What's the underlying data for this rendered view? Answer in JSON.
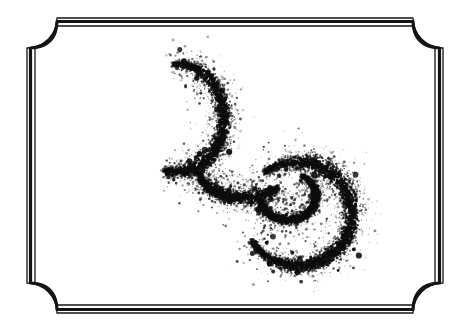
{
  "plate": {
    "width": 470,
    "height": 334,
    "background_color": "#ffffff",
    "ink_color": "#111111",
    "title": "Stippled Double-Spiral Plate",
    "caption": "",
    "has_caption": false,
    "has_text": false
  },
  "border": {
    "name": "ornamental-double-rule-frame",
    "style": "triple-rule: thin outer, thick middle, thin inner",
    "corner_style": "concave notched (inward quarter-round)",
    "color": "#141414",
    "bounds": {
      "left": 27,
      "top": 18,
      "right": 443,
      "bottom": 313
    },
    "corner_radius": 30,
    "rules": [
      {
        "name": "outer-rule",
        "inset": 0,
        "stroke_width": 1.3
      },
      {
        "name": "middle-rule",
        "inset": 3.5,
        "stroke_width": 3.2
      },
      {
        "name": "inner-rule",
        "inset": 8.0,
        "stroke_width": 1.3
      }
    ]
  },
  "figure": {
    "name": "stippled-double-spiral",
    "type": "pointillist-ink-stipple",
    "ink_color": "#0d0d0d",
    "dot_count": 7200,
    "seed": 20240517,
    "arcs": [
      {
        "name": "upper-arc",
        "shape": "c-arc-opening-right",
        "center_x": 178,
        "center_y": 118,
        "radius_x": 46,
        "radius_y": 54,
        "start_angle_deg": -96,
        "end_angle_deg": 108,
        "band_width": 17,
        "density": 1.0,
        "taper_start": 0.45,
        "taper_end": 0.95
      },
      {
        "name": "mid-connector",
        "shape": "diagonal-link",
        "center_x": 243,
        "center_y": 170,
        "radius_x": 44,
        "radius_y": 28,
        "start_angle_deg": 170,
        "end_angle_deg": 38,
        "band_width": 13,
        "density": 0.85,
        "taper_start": 0.7,
        "taper_end": 0.8
      },
      {
        "name": "lower-spiral",
        "shape": "reversed-c-spiral-opening-left",
        "center_x": 298,
        "center_y": 214,
        "radius_x": 54,
        "radius_y": 52,
        "start_angle_deg": -128,
        "end_angle_deg": 150,
        "band_width": 20,
        "density": 1.0,
        "taper_start": 0.9,
        "taper_end": 0.5
      },
      {
        "name": "inner-hook",
        "shape": "inward-curl",
        "center_x": 288,
        "center_y": 196,
        "radius_x": 28,
        "radius_y": 24,
        "start_angle_deg": -60,
        "end_angle_deg": 182,
        "band_width": 10,
        "density": 0.7,
        "taper_start": 0.6,
        "taper_end": 0.6
      }
    ],
    "spray": {
      "name": "edge-splatter",
      "count": 1500,
      "spread": 12,
      "size_min": 0.35,
      "size_max": 1.5
    },
    "blobs": {
      "name": "dark-clumps",
      "count": 130,
      "size_min": 1.2,
      "size_max": 3.2
    }
  }
}
